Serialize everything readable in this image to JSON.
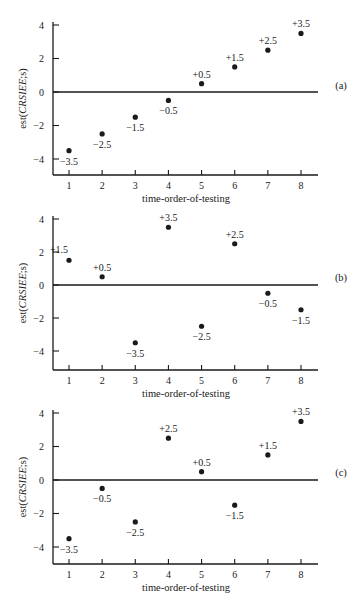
{
  "chart_data": [
    {
      "type": "scatter",
      "panel": "(a)",
      "xlabel": "time-order-of-testing",
      "ylabel": "est(CRSIEE;s)",
      "x": [
        1,
        2,
        3,
        4,
        5,
        6,
        7,
        8
      ],
      "values": [
        -3.5,
        -2.5,
        -1.5,
        -0.5,
        0.5,
        1.5,
        2.5,
        3.5
      ],
      "point_labels": [
        "−3.5",
        "−2.5",
        "−1.5",
        "−0.5",
        "+0.5",
        "+1.5",
        "+2.5",
        "+3.5"
      ],
      "xticks": [
        "1",
        "2",
        "3",
        "4",
        "5",
        "6",
        "7",
        "8"
      ],
      "yticks": [
        "4",
        "2",
        "0",
        "−2",
        "−4"
      ],
      "ylim": [
        -5,
        4.2
      ],
      "reference_line": 0,
      "grid": false
    },
    {
      "type": "scatter",
      "panel": "(b)",
      "xlabel": "time-order-of-testing",
      "ylabel": "est(CRSIEE;s)",
      "x": [
        1,
        2,
        3,
        4,
        5,
        6,
        7,
        8
      ],
      "values": [
        1.5,
        0.5,
        -3.5,
        3.5,
        -2.5,
        2.5,
        -0.5,
        -1.5
      ],
      "point_labels": [
        "+1.5",
        "+0.5",
        "−3.5",
        "+3.5",
        "−2.5",
        "+2.5",
        "−0.5",
        "−1.5"
      ],
      "xticks": [
        "1",
        "2",
        "3",
        "4",
        "5",
        "6",
        "7",
        "8"
      ],
      "yticks": [
        "4",
        "2",
        "0",
        "−2",
        "−4"
      ],
      "ylim": [
        -5,
        4.2
      ],
      "reference_line": 0,
      "grid": false
    },
    {
      "type": "scatter",
      "panel": "(c)",
      "xlabel": "time-order-of-testing",
      "ylabel": "est(CRSIEE;s)",
      "x": [
        1,
        2,
        3,
        4,
        5,
        6,
        7,
        8
      ],
      "values": [
        -3.5,
        -0.5,
        -2.5,
        2.5,
        0.5,
        -1.5,
        1.5,
        3.5
      ],
      "point_labels": [
        "−3.5",
        "−0.5",
        "−2.5",
        "+2.5",
        "+0.5",
        "−1.5",
        "+1.5",
        "+3.5"
      ],
      "xticks": [
        "1",
        "2",
        "3",
        "4",
        "5",
        "6",
        "7",
        "8"
      ],
      "yticks": [
        "4",
        "2",
        "0",
        "−2",
        "−4"
      ],
      "ylim": [
        -5,
        4.2
      ],
      "reference_line": 0,
      "grid": false
    }
  ],
  "colors": {
    "ink": "#1a1a1a",
    "background": "#ffffff"
  }
}
